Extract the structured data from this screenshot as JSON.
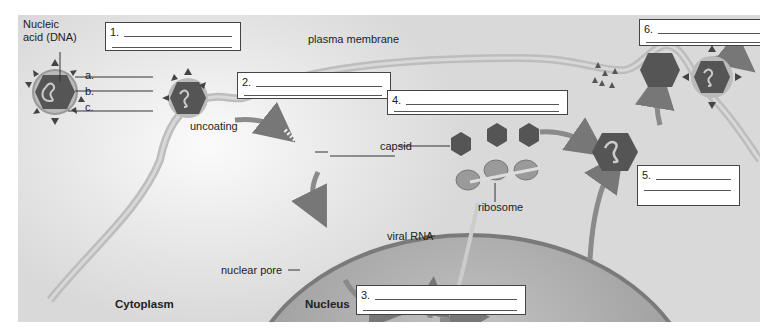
{
  "figure": {
    "regions": {
      "cytoplasm": "Cytoplasm",
      "nucleus": "Nucleus"
    },
    "labels": {
      "nucleic_acid": "Nucleic acid (DNA)",
      "nucleic_acid_line1": "Nucleic",
      "nucleic_acid_line2": "acid (DNA)",
      "part_a": "a.",
      "part_b": "b.",
      "part_c": "c.",
      "plasma_membrane": "plasma membrane",
      "uncoating": "uncoating",
      "capsid": "capsid",
      "ribosome": "ribosome",
      "viral_rna": "viral RNA",
      "nuclear_pore": "nuclear pore"
    },
    "answer_boxes": [
      {
        "number": "1.",
        "value": ""
      },
      {
        "number": "2.",
        "value": ""
      },
      {
        "number": "3.",
        "value": ""
      },
      {
        "number": "4.",
        "value": ""
      },
      {
        "number": "5.",
        "value": ""
      },
      {
        "number": "6.",
        "value": ""
      }
    ],
    "colors": {
      "background": "#e0e0e0",
      "membrane": "#b8b8b8",
      "capsid": "#555555",
      "nucleus": "#a8a8a8",
      "arrow": "#8a8a8a",
      "box_border": "#444444"
    }
  }
}
